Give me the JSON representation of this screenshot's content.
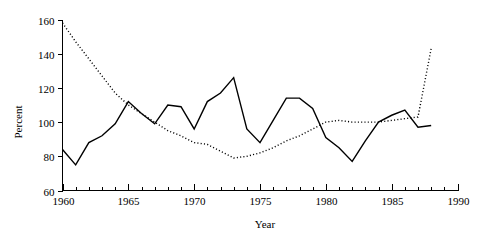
{
  "chart_data": {
    "type": "line",
    "title": "",
    "subtitle": "",
    "xlabel": "Year",
    "ylabel": "Percent",
    "xlim": [
      1960,
      1990
    ],
    "ylim": [
      60,
      160
    ],
    "x_major_ticks": [
      1960,
      1965,
      1970,
      1975,
      1980,
      1985,
      1990
    ],
    "x_major_tick_labels": [
      "1960",
      "1965",
      "1970",
      "1975",
      "1980",
      "1985",
      "1990"
    ],
    "x_minor_tick_step": 1,
    "y_ticks": [
      60,
      80,
      100,
      120,
      140,
      160
    ],
    "y_tick_labels": [
      "60",
      "80",
      "100",
      "120",
      "140",
      "160"
    ],
    "grid": false,
    "legend": "none",
    "x": [
      1960,
      1961,
      1962,
      1963,
      1964,
      1965,
      1966,
      1967,
      1968,
      1969,
      1970,
      1971,
      1972,
      1973,
      1974,
      1975,
      1976,
      1977,
      1978,
      1979,
      1980,
      1981,
      1982,
      1983,
      1984,
      1985,
      1986,
      1987,
      1988
    ],
    "series": [
      {
        "name": "solid-series",
        "style": "solid",
        "color": "#000000",
        "values": [
          84,
          75,
          88,
          92,
          99,
          112,
          105,
          99,
          110,
          109,
          96,
          112,
          117,
          126,
          96,
          88,
          101,
          114,
          114,
          108,
          91,
          85,
          77,
          89,
          100,
          104,
          107,
          97,
          98
        ]
      },
      {
        "name": "dotted-series",
        "style": "dotted",
        "color": "#000000",
        "values": [
          158,
          147,
          137,
          127,
          117,
          110,
          105,
          100,
          95,
          92,
          88,
          87,
          83,
          79,
          80,
          82,
          85,
          89,
          92,
          96,
          100,
          101,
          100,
          100,
          100,
          101,
          102,
          103,
          143
        ]
      }
    ]
  },
  "axes": {
    "ylabel": "Percent",
    "xlabel": "Year"
  }
}
